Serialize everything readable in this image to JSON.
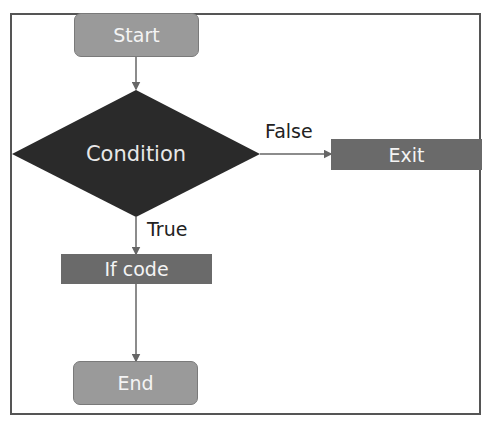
{
  "diagram": {
    "type": "flowchart",
    "nodes": {
      "start": "Start",
      "condition": "Condition",
      "exit": "Exit",
      "if_code": "If code",
      "end": "End"
    },
    "edge_labels": {
      "false": "False",
      "true": "True"
    },
    "colors": {
      "terminal": "#9a9a9a",
      "process": "#6a6a6a",
      "decision": "#2a2a2a",
      "edge": "#666666"
    }
  }
}
